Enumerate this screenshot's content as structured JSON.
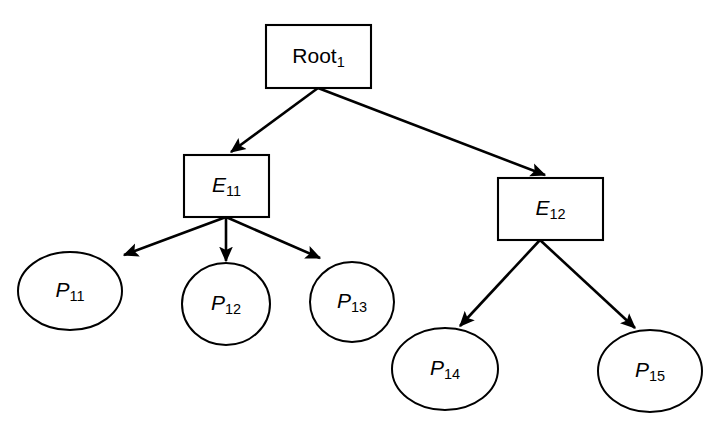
{
  "diagram": {
    "type": "tree",
    "background_color": "#ffffff",
    "line_color": "#000000",
    "node_fill": "#ffffff",
    "nodes": [
      {
        "id": "root1",
        "label_base": "Root",
        "label_sub": "1",
        "shape": "rectangle",
        "italic": false,
        "x": 266,
        "y": 25,
        "w": 105,
        "h": 63,
        "cx": 318.5,
        "cy": 56.5
      },
      {
        "id": "e11",
        "label_base": "E",
        "label_sub": "11",
        "shape": "rectangle",
        "italic": true,
        "x": 184,
        "y": 155,
        "w": 85,
        "h": 62,
        "cx": 226.5,
        "cy": 186
      },
      {
        "id": "e12",
        "label_base": "E",
        "label_sub": "12",
        "shape": "rectangle",
        "italic": true,
        "x": 498,
        "y": 178,
        "w": 105,
        "h": 62,
        "cx": 550.5,
        "cy": 209
      },
      {
        "id": "p11",
        "label_base": "P",
        "label_sub": "11",
        "shape": "ellipse",
        "italic": true,
        "cx": 70,
        "cy": 291,
        "rx": 52,
        "ry": 39
      },
      {
        "id": "p12",
        "label_base": "P",
        "label_sub": "12",
        "shape": "ellipse",
        "italic": true,
        "cx": 226,
        "cy": 304,
        "rx": 44,
        "ry": 41
      },
      {
        "id": "p13",
        "label_base": "P",
        "label_sub": "13",
        "shape": "ellipse",
        "italic": true,
        "cx": 352,
        "cy": 302,
        "rx": 42,
        "ry": 40
      },
      {
        "id": "p14",
        "label_base": "P",
        "label_sub": "14",
        "shape": "ellipse",
        "italic": true,
        "cx": 445,
        "cy": 369,
        "rx": 53,
        "ry": 41
      },
      {
        "id": "p15",
        "label_base": "P",
        "label_sub": "15",
        "shape": "ellipse",
        "italic": true,
        "cx": 650,
        "cy": 371,
        "rx": 52,
        "ry": 41
      }
    ],
    "edges": [
      {
        "id": "root1-e11",
        "from": "root1",
        "to": "e11",
        "x1": 318,
        "y1": 88,
        "x2": 231,
        "y2": 152
      },
      {
        "id": "root1-e12",
        "from": "root1",
        "to": "e12",
        "x1": 318,
        "y1": 88,
        "x2": 545,
        "y2": 175
      },
      {
        "id": "e11-p11",
        "from": "e11",
        "to": "p11",
        "x1": 226,
        "y1": 217,
        "x2": 124,
        "y2": 255
      },
      {
        "id": "e11-p12",
        "from": "e11",
        "to": "p12",
        "x1": 226,
        "y1": 217,
        "x2": 226,
        "y2": 261
      },
      {
        "id": "e11-p13",
        "from": "e11",
        "to": "p13",
        "x1": 226,
        "y1": 217,
        "x2": 320,
        "y2": 258
      },
      {
        "id": "e12-p14",
        "from": "e12",
        "to": "p14",
        "x1": 540,
        "y1": 240,
        "x2": 460,
        "y2": 326
      },
      {
        "id": "e12-p15",
        "from": "e12",
        "to": "p15",
        "x1": 540,
        "y1": 240,
        "x2": 635,
        "y2": 328
      }
    ]
  }
}
